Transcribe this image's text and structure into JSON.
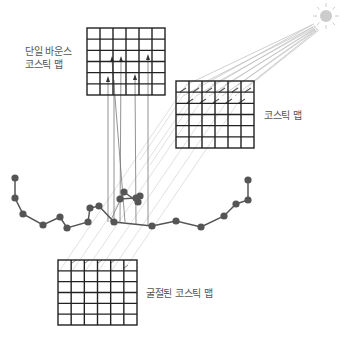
{
  "labels": {
    "single_bounce_line1": "단일 바운스",
    "single_bounce_line2": "코스틱 맵",
    "caustic_map": "코스틱 맵",
    "refracted_caustic_map": "굴절된 코스틱 맵"
  },
  "colors": {
    "grid": "#222222",
    "ray": "#bbbbbb",
    "reflect_ray": "#777777",
    "node": "#555555",
    "sun": "#cccccc",
    "text": "#555555"
  },
  "grids": [
    {
      "name": "single-bounce-caustic-map",
      "x": 87,
      "y": 28,
      "w": 78,
      "h": 67,
      "cols": 6,
      "rows": 6
    },
    {
      "name": "caustic-map",
      "x": 176,
      "y": 81,
      "w": 78,
      "h": 67,
      "cols": 6,
      "rows": 6
    },
    {
      "name": "refracted-caustic-map",
      "x": 58,
      "y": 260,
      "w": 79,
      "h": 65,
      "cols": 6,
      "rows": 6
    }
  ],
  "sun": {
    "cx": 326,
    "cy": 16,
    "r": 6
  },
  "surface_nodes": [
    [
      15,
      178
    ],
    [
      15,
      198
    ],
    [
      23,
      214
    ],
    [
      43,
      225
    ],
    [
      60,
      217
    ],
    [
      67,
      228
    ],
    [
      88,
      222
    ],
    [
      90,
      208
    ],
    [
      99,
      206
    ],
    [
      114,
      222
    ],
    [
      152,
      226
    ],
    [
      176,
      221
    ],
    [
      201,
      227
    ],
    [
      224,
      216
    ],
    [
      236,
      204
    ],
    [
      248,
      200
    ],
    [
      248,
      180
    ]
  ],
  "cluster_nodes": [
    [
      124,
      192
    ],
    [
      120,
      199
    ],
    [
      136,
      198
    ],
    [
      140,
      196
    ],
    [
      138,
      202
    ]
  ]
}
